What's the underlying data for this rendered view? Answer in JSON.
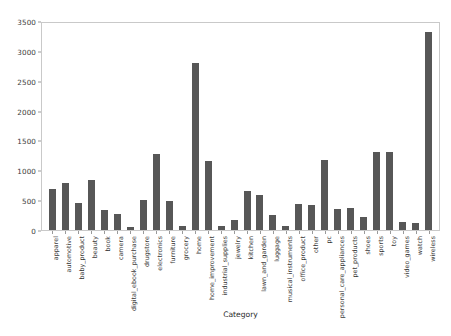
{
  "chart_data": {
    "type": "bar",
    "title": "",
    "xlabel": "Category",
    "ylabel": "",
    "ylim": [
      0,
      3500
    ],
    "yticks": [
      "0",
      "500",
      "1000",
      "1500",
      "2000",
      "2500",
      "3000",
      "3500"
    ],
    "grid": false,
    "legend": null,
    "bar_color": "#575757",
    "categories": [
      "apparel",
      "automotive",
      "baby_product",
      "beauty",
      "book",
      "camera",
      "digital_ebook_purchase",
      "drugstore",
      "electronics",
      "furniture",
      "grocery",
      "home",
      "home_improvement",
      "industrial_supplies",
      "jewelry",
      "kitchen",
      "lawn_and_garden",
      "luggage",
      "musical_instruments",
      "office_product",
      "other",
      "pc",
      "personal_care_appliances",
      "pet_products",
      "shoes",
      "sports",
      "toy",
      "video_games",
      "watch",
      "wireless"
    ],
    "values": [
      680,
      790,
      460,
      830,
      330,
      260,
      50,
      500,
      1270,
      490,
      60,
      2790,
      1150,
      70,
      160,
      660,
      580,
      250,
      70,
      440,
      420,
      1180,
      360,
      370,
      220,
      1300,
      1310,
      130,
      110,
      3310
    ]
  }
}
